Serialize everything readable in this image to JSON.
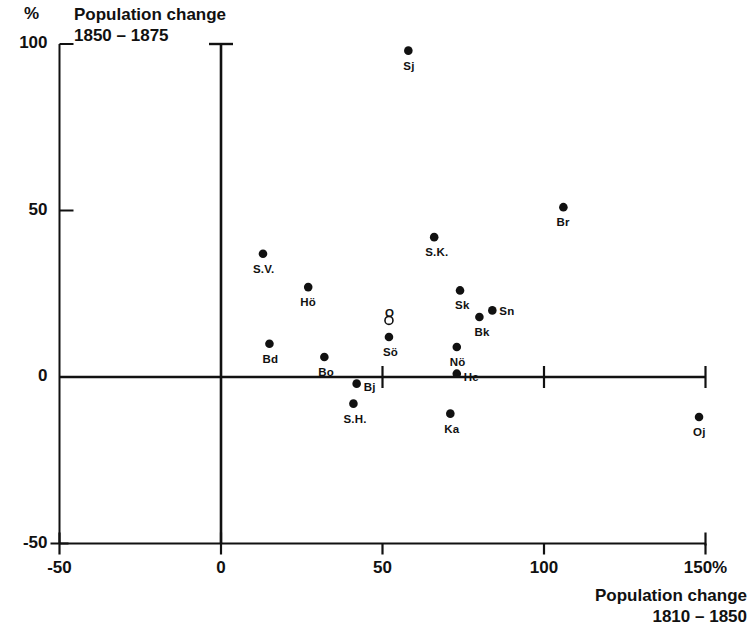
{
  "chart_data": {
    "type": "scatter",
    "title_line1": "Population change",
    "title_line2": "1850 – 1875",
    "ylabel": "%",
    "xlabel": "Population change 1810 – 1850",
    "xlabel_line1": "Population change",
    "xlabel_line2": "1810 – 1850",
    "xlim": [
      -50,
      150
    ],
    "ylim": [
      -50,
      100
    ],
    "grid": false,
    "legend": false,
    "x_unit_suffix": "%",
    "xticks": [
      -50,
      0,
      50,
      100,
      150
    ],
    "xtick_labels": [
      "-50",
      "0",
      "50",
      "100",
      "150%"
    ],
    "yticks": [
      -50,
      0,
      50,
      100
    ],
    "ytick_labels": [
      "-50",
      "0",
      "50",
      "100"
    ],
    "points": [
      {
        "label": "Sj",
        "x": 58,
        "y": 98,
        "marker": "filled",
        "label_dx": -5,
        "label_dy": 16
      },
      {
        "label": "Br",
        "x": 106,
        "y": 51,
        "marker": "filled",
        "label_dx": -7,
        "label_dy": 16
      },
      {
        "label": "S.K.",
        "x": 66,
        "y": 42,
        "marker": "filled",
        "label_dx": -9,
        "label_dy": 16
      },
      {
        "label": "S.V.",
        "x": 13,
        "y": 37,
        "marker": "filled",
        "label_dx": -10,
        "label_dy": 16
      },
      {
        "label": "Hö",
        "x": 27,
        "y": 27,
        "marker": "filled",
        "label_dx": -8,
        "label_dy": 16
      },
      {
        "label": "Sk",
        "x": 74,
        "y": 26,
        "marker": "filled",
        "label_dx": -5,
        "label_dy": 16
      },
      {
        "label": "Sn",
        "x": 84,
        "y": 20,
        "marker": "filled",
        "label_dx": 7,
        "label_dy": 2
      },
      {
        "label": "Bk",
        "x": 80,
        "y": 18,
        "marker": "filled",
        "label_dx": -5,
        "label_dy": 16
      },
      {
        "label": "O",
        "x": 52,
        "y": 17,
        "marker": "open",
        "label_dx": -4,
        "label_dy": -6
      },
      {
        "label": "Sö",
        "x": 52,
        "y": 12,
        "marker": "filled",
        "label_dx": -6,
        "label_dy": 16
      },
      {
        "label": "Bd",
        "x": 15,
        "y": 10,
        "marker": "filled",
        "label_dx": -7,
        "label_dy": 16
      },
      {
        "label": "Nö",
        "x": 73,
        "y": 9,
        "marker": "filled",
        "label_dx": -7,
        "label_dy": 16
      },
      {
        "label": "Bo",
        "x": 32,
        "y": 6,
        "marker": "filled",
        "label_dx": -6,
        "label_dy": 16
      },
      {
        "label": "He",
        "x": 73,
        "y": 1,
        "marker": "filled",
        "label_dx": 7,
        "label_dy": 4
      },
      {
        "label": "Bj",
        "x": 42,
        "y": -2,
        "marker": "filled",
        "label_dx": 7,
        "label_dy": 4
      },
      {
        "label": "S.H.",
        "x": 41,
        "y": -8,
        "marker": "filled",
        "label_dx": -10,
        "label_dy": 16
      },
      {
        "label": "Ka",
        "x": 71,
        "y": -11,
        "marker": "filled",
        "label_dx": -6,
        "label_dy": 16
      },
      {
        "label": "Oj",
        "x": 148,
        "y": -12,
        "marker": "filled",
        "label_dx": -6,
        "label_dy": 16
      }
    ]
  },
  "colors": {
    "axis": "#111111",
    "marker": "#111111",
    "background": "#ffffff"
  }
}
